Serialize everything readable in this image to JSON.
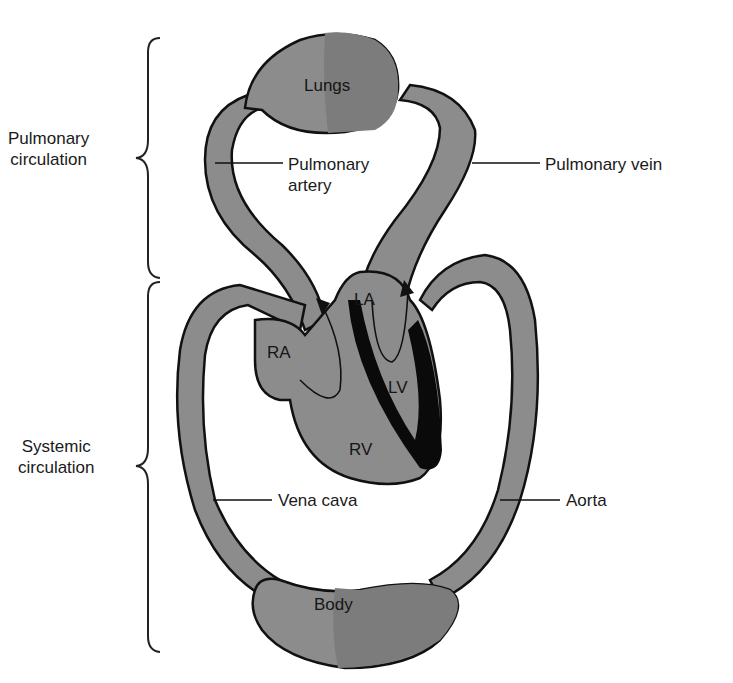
{
  "diagram": {
    "type": "circulatory system schematic",
    "colors": {
      "vessel_fill": "#8c8c8c",
      "vessel_fill_dark": "#7a7a7a",
      "outline": "#111111",
      "septum": "#0a0a0a",
      "background": "#ffffff"
    },
    "brackets": [
      {
        "label_line1": "Pulmonary",
        "label_line2": "circulation"
      },
      {
        "label_line1": "Systemic",
        "label_line2": "circulation"
      }
    ],
    "organs": {
      "lungs": "Lungs",
      "body": "Body"
    },
    "chambers": {
      "ra": "RA",
      "la": "LA",
      "lv": "LV",
      "rv": "RV"
    },
    "callouts": {
      "pulmonary_artery_line1": "Pulmonary",
      "pulmonary_artery_line2": "artery",
      "pulmonary_vein": "Pulmonary vein",
      "vena_cava": "Vena cava",
      "aorta": "Aorta"
    }
  }
}
